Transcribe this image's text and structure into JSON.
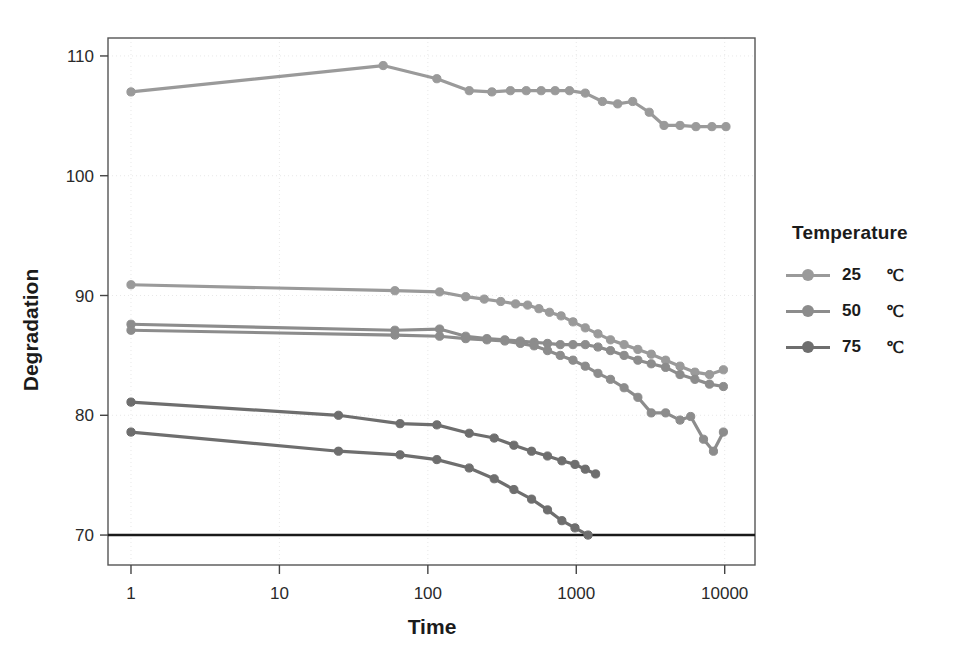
{
  "chart_data": {
    "type": "line",
    "title": "",
    "xlabel": "Time",
    "ylabel": "Degradation",
    "xscale": "log",
    "xlim": [
      0.7,
      16000
    ],
    "ylim": [
      67.5,
      111.5
    ],
    "xticks": [
      1,
      10,
      100,
      1000,
      10000
    ],
    "xtick_labels": [
      "1",
      "10",
      "100",
      "1000",
      "10000"
    ],
    "yticks": [
      70,
      80,
      90,
      100,
      110
    ],
    "ytick_labels": [
      "70",
      "80",
      "90",
      "100",
      "110"
    ],
    "grid": true,
    "legend_position": "right",
    "legend_title": "Temperature",
    "reference_line": {
      "y": 70,
      "color": "#1a1a1a",
      "label": ""
    },
    "series": [
      {
        "name": "25 °C upper",
        "legend_group": "25 °C",
        "color": "#9a9a9a",
        "points": [
          [
            1,
            107.0
          ],
          [
            50,
            109.2
          ],
          [
            115,
            108.1
          ],
          [
            190,
            107.1
          ],
          [
            270,
            107.0
          ],
          [
            360,
            107.1
          ],
          [
            460,
            107.1
          ],
          [
            580,
            107.1
          ],
          [
            720,
            107.1
          ],
          [
            900,
            107.1
          ],
          [
            1150,
            106.9
          ],
          [
            1500,
            106.2
          ],
          [
            1900,
            106.0
          ],
          [
            2400,
            106.2
          ],
          [
            3100,
            105.3
          ],
          [
            3900,
            104.2
          ],
          [
            5000,
            104.2
          ],
          [
            6400,
            104.1
          ],
          [
            8200,
            104.1
          ],
          [
            10200,
            104.1
          ]
        ]
      },
      {
        "name": "25 °C lower",
        "legend_group": "25 °C",
        "color": "#9a9a9a",
        "points": [
          [
            1,
            90.9
          ],
          [
            60,
            90.4
          ],
          [
            120,
            90.3
          ],
          [
            180,
            89.9
          ],
          [
            240,
            89.7
          ],
          [
            310,
            89.5
          ],
          [
            390,
            89.3
          ],
          [
            470,
            89.2
          ],
          [
            560,
            88.9
          ],
          [
            660,
            88.6
          ],
          [
            790,
            88.3
          ],
          [
            950,
            87.8
          ],
          [
            1150,
            87.3
          ],
          [
            1400,
            86.8
          ],
          [
            1700,
            86.3
          ],
          [
            2100,
            85.9
          ],
          [
            2600,
            85.5
          ],
          [
            3200,
            85.1
          ],
          [
            4000,
            84.6
          ],
          [
            5000,
            84.1
          ],
          [
            6300,
            83.6
          ],
          [
            7900,
            83.4
          ],
          [
            9800,
            83.8
          ]
        ]
      },
      {
        "name": "50 °C upper",
        "legend_group": "50 °C",
        "color": "#8c8c8c",
        "points": [
          [
            1,
            87.6
          ],
          [
            60,
            87.1
          ],
          [
            120,
            87.2
          ],
          [
            180,
            86.6
          ],
          [
            250,
            86.4
          ],
          [
            330,
            86.3
          ],
          [
            420,
            86.2
          ],
          [
            520,
            86.1
          ],
          [
            640,
            86.0
          ],
          [
            780,
            85.9
          ],
          [
            950,
            85.9
          ],
          [
            1150,
            85.9
          ],
          [
            1400,
            85.7
          ],
          [
            1700,
            85.4
          ],
          [
            2100,
            85.0
          ],
          [
            2600,
            84.6
          ],
          [
            3200,
            84.3
          ],
          [
            4000,
            84.0
          ],
          [
            5000,
            83.4
          ],
          [
            6300,
            83.0
          ],
          [
            7900,
            82.6
          ],
          [
            9800,
            82.4
          ]
        ]
      },
      {
        "name": "50 °C lower",
        "legend_group": "50 °C",
        "color": "#8c8c8c",
        "points": [
          [
            1,
            87.1
          ],
          [
            60,
            86.7
          ],
          [
            120,
            86.6
          ],
          [
            180,
            86.4
          ],
          [
            250,
            86.3
          ],
          [
            330,
            86.2
          ],
          [
            420,
            86.0
          ],
          [
            520,
            85.8
          ],
          [
            640,
            85.4
          ],
          [
            780,
            85.0
          ],
          [
            950,
            84.6
          ],
          [
            1150,
            84.1
          ],
          [
            1400,
            83.5
          ],
          [
            1700,
            83.0
          ],
          [
            2100,
            82.3
          ],
          [
            2600,
            81.5
          ],
          [
            3200,
            80.2
          ],
          [
            4000,
            80.2
          ],
          [
            5000,
            79.6
          ],
          [
            5900,
            79.9
          ],
          [
            7200,
            78.0
          ],
          [
            8400,
            77.0
          ],
          [
            9800,
            78.6
          ]
        ]
      },
      {
        "name": "75 °C upper",
        "legend_group": "75 °C",
        "color": "#6e6e6e",
        "points": [
          [
            1,
            81.1
          ],
          [
            25,
            80.0
          ],
          [
            65,
            79.3
          ],
          [
            115,
            79.2
          ],
          [
            190,
            78.5
          ],
          [
            280,
            78.1
          ],
          [
            380,
            77.5
          ],
          [
            500,
            77.0
          ],
          [
            640,
            76.6
          ],
          [
            800,
            76.2
          ],
          [
            980,
            75.9
          ],
          [
            1150,
            75.5
          ],
          [
            1350,
            75.1
          ]
        ]
      },
      {
        "name": "75 °C lower",
        "legend_group": "75 °C",
        "color": "#6e6e6e",
        "points": [
          [
            1,
            78.6
          ],
          [
            25,
            77.0
          ],
          [
            65,
            76.7
          ],
          [
            115,
            76.3
          ],
          [
            190,
            75.6
          ],
          [
            280,
            74.7
          ],
          [
            380,
            73.8
          ],
          [
            500,
            73.0
          ],
          [
            640,
            72.1
          ],
          [
            800,
            71.2
          ],
          [
            980,
            70.6
          ],
          [
            1200,
            70.0
          ]
        ]
      }
    ]
  },
  "legend": {
    "title": "Temperature",
    "items": [
      {
        "value": "25",
        "unit": "℃",
        "color": "#9a9a9a"
      },
      {
        "value": "50",
        "unit": "℃",
        "color": "#8c8c8c"
      },
      {
        "value": "75",
        "unit": "℃",
        "color": "#6e6e6e"
      }
    ]
  }
}
